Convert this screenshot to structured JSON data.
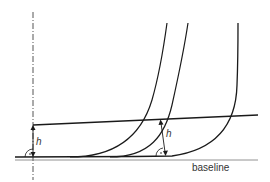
{
  "diagram": {
    "labels": {
      "h_left": "h",
      "h_right": "h",
      "baseline": "baseline"
    },
    "colors": {
      "line": "#1a1a1a",
      "baseline": "#777777",
      "text": "#333333"
    }
  }
}
